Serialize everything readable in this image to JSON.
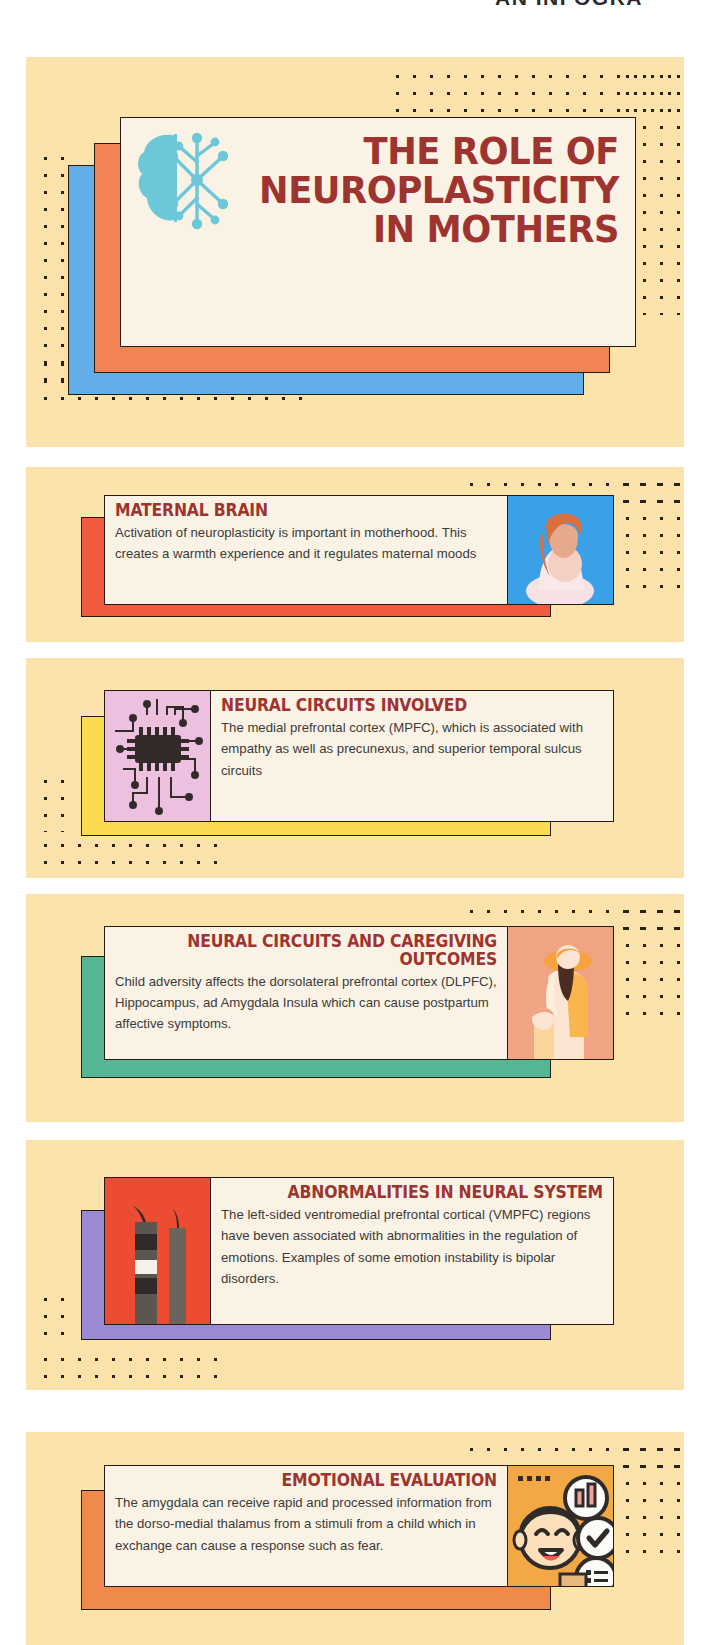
{
  "top_banner": {
    "partial_text": "AN INFOGRA"
  },
  "header": {
    "title_line1": "THE ROLE OF",
    "title_line2": "NEUROPLASTICITY",
    "title_line3": "IN MOTHERS",
    "title_full": "THE ROLE OF NEUROPLASTICITY IN MOTHERS",
    "icon": "brain-neuron-icon",
    "colors": {
      "background": "#fbe3ab",
      "card": "#faf3e5",
      "title": "#9e3430",
      "shadow_blue": "#62aee8",
      "shadow_orange": "#f28352",
      "brain_icon": "#6cc8d8"
    }
  },
  "cards": [
    {
      "id": "maternal-brain",
      "title": "MATERNAL BRAIN",
      "body": "Activation of neuroplasticity is important in motherhood. This creates a warmth experience and it regulates maternal moods",
      "title_align": "left",
      "image_side": "right",
      "image_name": "pregnant-woman-photo",
      "shadow_color": "#ef5b3c",
      "image_bg": "#3aa0e8"
    },
    {
      "id": "neural-circuits-involved",
      "title": "NEURAL CIRCUITS INVOLVED",
      "body": "The medial prefrontal cortex (MPFC), which is associated with empathy as well as precunexus, and superior temporal sulcus circuits",
      "title_align": "left",
      "image_side": "left",
      "image_name": "microchip-circuit-illustration",
      "shadow_color": "#fada4e",
      "image_bg": "#eec0e0"
    },
    {
      "id": "neural-circuits-caregiving-outcomes",
      "title": "NEURAL CIRCUITS AND CAREGIVING OUTCOMES",
      "body": "Child adversity affects the dorsolateral prefrontal cortex (DLPFC), Hippocampus, ad Amygdala Insula which can cause postpartum affective symptoms.",
      "title_align": "center-right",
      "image_side": "right",
      "image_name": "mother-and-child-illustration",
      "shadow_color": "#56b592",
      "image_bg": "#f0a483"
    },
    {
      "id": "abnormalities-in-neural-system",
      "title": "ABNORMALITIES IN NEURAL SYSTEM",
      "body": "The left-sided ventromedial prefrontal cortical (VMPFC) regions have beven associated with abnormalities in the regulation of emotions. Examples of some emotion instability is bipolar disorders.",
      "title_align": "right",
      "image_side": "left",
      "image_name": "dynamite-sticks-illustration",
      "shadow_color": "#9a8ad1",
      "image_bg": "#ec4d32"
    },
    {
      "id": "emotional-evaluation",
      "title": "EMOTIONAL EVALUATION",
      "body": "The amygdala can receive rapid  and processed information  from the dorso-medial thalamus from a stimuli from a child which in exchange can cause a response such as fear.",
      "title_align": "center-right",
      "image_side": "right",
      "image_name": "person-with-chat-bubbles-illustration",
      "shadow_color": "#f08a4b",
      "image_bg": "#f2a945"
    }
  ]
}
